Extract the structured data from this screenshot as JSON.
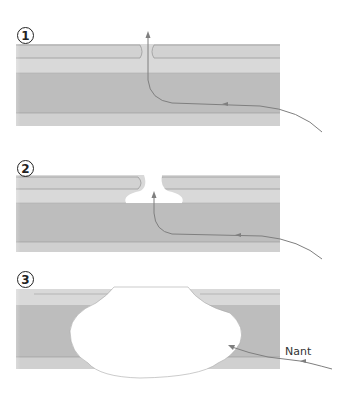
{
  "diagram": {
    "type": "process-steps",
    "colors": {
      "upper_layer": "#d4d4d4",
      "upper_layer_inner": "#dcdcdc",
      "lower_layer": "#bcbcbc",
      "outline": "#8c8c8c",
      "arrow": "#7f7f7f",
      "cavity": "#ffffff"
    },
    "steps": [
      {
        "number": "1",
        "state": "narrow-channel",
        "arrow": "vertical-exit"
      },
      {
        "number": "2",
        "state": "widening-pocket",
        "arrow": "into-pocket"
      },
      {
        "number": "3",
        "state": "large-cavity",
        "arrow": "into-cavity",
        "label": "Nant"
      }
    ]
  }
}
